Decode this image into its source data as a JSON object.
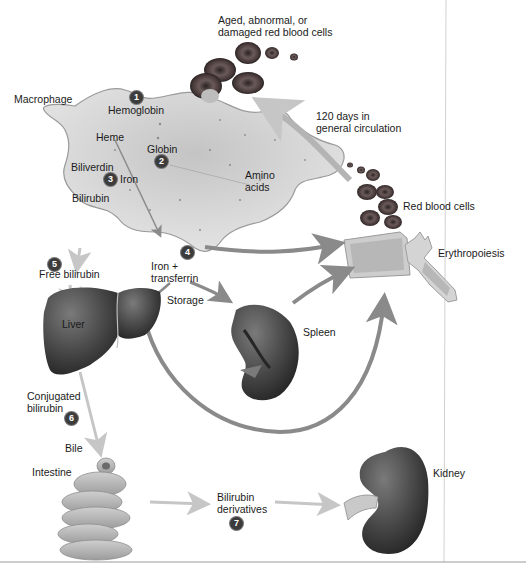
{
  "diagram": {
    "title_hint": "Hemoglobin recycling and erythropoiesis",
    "labels": {
      "aged_rbc": "Aged, abnormal, or\ndamaged red blood cells",
      "macrophage": "Macrophage",
      "hemoglobin": "Hemoglobin",
      "heme": "Heme",
      "globin": "Globin",
      "biliverdin": "Biliverdin",
      "iron": "Iron",
      "bilirubin": "Bilirubin",
      "amino_acids": "Amino\nacids",
      "circulation": "120 days in\ngeneral circulation",
      "red_blood_cells": "Red blood cells",
      "erythropoiesis": "Erythropoiesis",
      "free_bilirubin": "Free bilirubin",
      "iron_transferrin": "Iron +\ntransferrin",
      "storage": "Storage",
      "liver": "Liver",
      "spleen": "Spleen",
      "conjugated_bilirubin": "Conjugated\nbilirubin",
      "bile": "Bile",
      "intestine": "Intestine",
      "bilirubin_derivatives": "Bilirubin\nderivatives",
      "kidney": "Kidney"
    },
    "steps": [
      "1",
      "2",
      "3",
      "4",
      "5",
      "6",
      "7"
    ],
    "colors": {
      "macrophage_fill": "#d9d9d9",
      "rbc": "#5a4a4a",
      "organ": "#4a4a4a",
      "arrow_dark": "#8a8a8a",
      "arrow_light": "#c8c8c8",
      "step_badge": "#3c3c3c"
    }
  }
}
